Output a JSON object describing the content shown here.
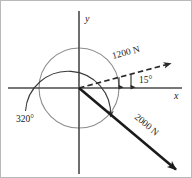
{
  "figure": {
    "background_color": "#ffffff",
    "axes": {
      "x_label": "x",
      "y_label": "y",
      "origin": {
        "x": 78,
        "y": 87
      },
      "x_axis_start_x": 7,
      "x_axis_end_x": 181,
      "y_axis_start_y": 10,
      "y_axis_end_y": 173,
      "color": "#4a4a4a"
    },
    "circle": {
      "name": "reference-circle",
      "center_x": 78,
      "center_y": 87,
      "radius": 40,
      "color": "#8d8d8d"
    },
    "vectors": [
      {
        "name": "force-1200",
        "label": "1200 N",
        "magnitude": 1200,
        "unit": "N",
        "style": "dashed",
        "angle_deg_from_x_axis": 15,
        "direction": "up-right",
        "tip_x": 172,
        "tip_y": 62,
        "label_rotation_deg": -15,
        "color": "#2a2a2a"
      },
      {
        "name": "force-2000",
        "label": "2000 N",
        "magnitude": 2000,
        "unit": "N",
        "style": "solid",
        "angle_deg_from_x_axis": -40,
        "direction": "down-right",
        "tip_x": 178,
        "tip_y": 172,
        "label_rotation_deg": 40,
        "color": "#1b1b1b"
      }
    ],
    "angle_annotations": [
      {
        "name": "angle-15",
        "label": "15°",
        "value": 15,
        "unit": "deg",
        "between": [
          "force-1200",
          "x-axis"
        ],
        "label_x": 139,
        "label_y": 82
      },
      {
        "name": "angle-320",
        "label": "320°",
        "value": 320,
        "unit": "deg",
        "measured_from": "x-axis",
        "sweep": "counterclockwise",
        "to": "force-2000",
        "label_x": 17,
        "label_y": 121
      }
    ]
  }
}
